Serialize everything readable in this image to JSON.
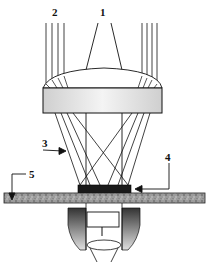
{
  "diagram": {
    "type": "optical-schematic",
    "labels": {
      "l1": "1",
      "l2": "2",
      "l3": "3",
      "l4": "4",
      "l5": "5",
      "objective_mark": "1"
    },
    "components": [
      {
        "id": "1",
        "name": "central beam"
      },
      {
        "id": "2",
        "name": "parallel peripheral rays"
      },
      {
        "id": "3",
        "name": "converging rays"
      },
      {
        "id": "4",
        "name": "sample"
      },
      {
        "id": "5",
        "name": "substrate"
      }
    ],
    "colors": {
      "line": "#111111",
      "lens_fill": "#e4e4e4",
      "substrate_fill": "#9a9a9a",
      "sample_fill": "#1a1a1a",
      "objective_dark": "#444444"
    }
  }
}
